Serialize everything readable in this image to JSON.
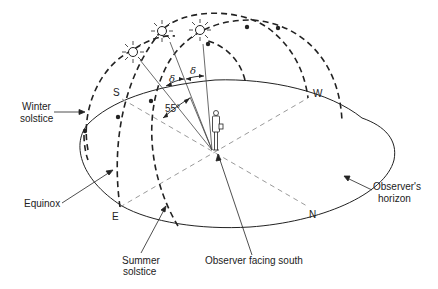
{
  "diagram": {
    "labels": {
      "winter_solstice": [
        "Winter",
        "solstice"
      ],
      "equinox": "Equinox",
      "summer_solstice": [
        "Summer",
        "solstice"
      ],
      "observer_facing_south": "Observer facing south",
      "observers_horizon": [
        "Observer's",
        "horizon"
      ]
    },
    "compass": {
      "south": "S",
      "west": "W",
      "east": "E",
      "north": "N"
    },
    "angles": {
      "latitude_angle": "55°",
      "declination_1": "δ",
      "declination_2": "δ"
    },
    "sun_paths": [
      {
        "name": "Winter solstice path",
        "style": "dashed"
      },
      {
        "name": "Equinox path",
        "style": "dashed"
      },
      {
        "name": "Summer solstice path",
        "style": "dashed"
      }
    ],
    "colors": {
      "line": "#222222",
      "guide": "#9a9a9a",
      "background": "#ffffff"
    }
  }
}
